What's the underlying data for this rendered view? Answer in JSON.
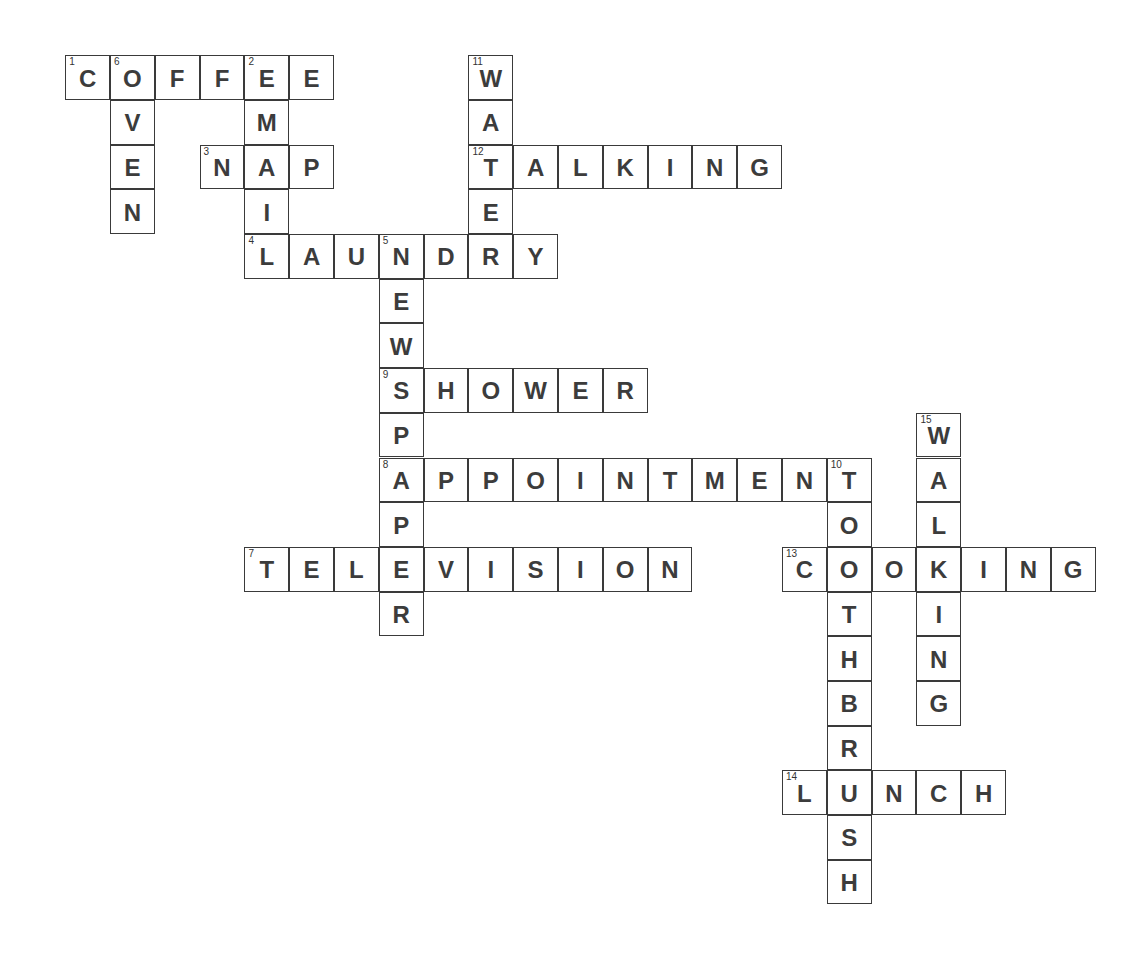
{
  "puzzle": {
    "origin": {
      "x": 66,
      "y": 56
    },
    "pitch": {
      "x": 44.8,
      "y": 44.7
    },
    "words": [
      {
        "number": 1,
        "answer": "COFFEE",
        "direction": "across",
        "row": 0,
        "col": 0
      },
      {
        "number": 2,
        "answer": "EMAIL",
        "direction": "down",
        "row": 0,
        "col": 4
      },
      {
        "number": 3,
        "answer": "NAP",
        "direction": "across",
        "row": 2,
        "col": 3
      },
      {
        "number": 4,
        "answer": "LAUNDRY",
        "direction": "across",
        "row": 4,
        "col": 4
      },
      {
        "number": 5,
        "answer": "NEWSPAPER",
        "direction": "down",
        "row": 4,
        "col": 7
      },
      {
        "number": 6,
        "answer": "OVEN",
        "direction": "down",
        "row": 0,
        "col": 1
      },
      {
        "number": 7,
        "answer": "TELEVISION",
        "direction": "across",
        "row": 11,
        "col": 4
      },
      {
        "number": 8,
        "answer": "APPOINTMENT",
        "direction": "across",
        "row": 9,
        "col": 7
      },
      {
        "number": 9,
        "answer": "SHOWER",
        "direction": "across",
        "row": 7,
        "col": 7
      },
      {
        "number": 10,
        "answer": "TOOTHBRUSH",
        "direction": "down",
        "row": 9,
        "col": 17
      },
      {
        "number": 11,
        "answer": "WATER",
        "direction": "down",
        "row": 0,
        "col": 9
      },
      {
        "number": 12,
        "answer": "TALKING",
        "direction": "across",
        "row": 2,
        "col": 9
      },
      {
        "number": 13,
        "answer": "COOKING",
        "direction": "across",
        "row": 11,
        "col": 16
      },
      {
        "number": 14,
        "answer": "LUNCH",
        "direction": "across",
        "row": 16,
        "col": 16
      },
      {
        "number": 15,
        "answer": "WALKING",
        "direction": "down",
        "row": 8,
        "col": 19
      }
    ]
  }
}
